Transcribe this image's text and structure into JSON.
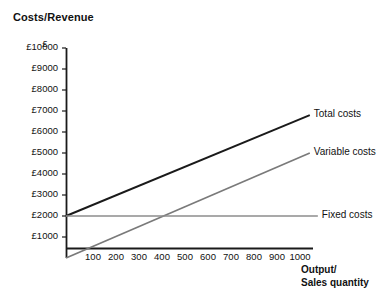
{
  "chart_data": {
    "type": "line",
    "title": "Costs/Revenue",
    "ylabel": "£",
    "xlabel": "Output/\nSales quantity",
    "xlabel_lines": [
      "Output/",
      "Sales quantity"
    ],
    "xlim": [
      0,
      1070
    ],
    "ylim": [
      0,
      10000
    ],
    "grid": false,
    "legend_position": "right-inline-labels",
    "yticks": [
      {
        "value": 10000,
        "label": "£10000"
      },
      {
        "value": 9000,
        "label": "£9000"
      },
      {
        "value": 8000,
        "label": "£8000"
      },
      {
        "value": 7000,
        "label": "£7000"
      },
      {
        "value": 6000,
        "label": "£6000"
      },
      {
        "value": 5000,
        "label": "£5000"
      },
      {
        "value": 4000,
        "label": "£4000"
      },
      {
        "value": 3000,
        "label": "£3000"
      },
      {
        "value": 2000,
        "label": "£2000"
      },
      {
        "value": 1000,
        "label": "£1000"
      }
    ],
    "xticks": [
      {
        "value": 100,
        "label": "100"
      },
      {
        "value": 200,
        "label": "200"
      },
      {
        "value": 300,
        "label": "300"
      },
      {
        "value": 400,
        "label": "400"
      },
      {
        "value": 500,
        "label": "500"
      },
      {
        "value": 600,
        "label": "600"
      },
      {
        "value": 700,
        "label": "700"
      },
      {
        "value": 800,
        "label": "800"
      },
      {
        "value": 900,
        "label": "900"
      },
      {
        "value": 1000,
        "label": "1000"
      }
    ],
    "series": [
      {
        "name": "Total costs",
        "label": "Total costs",
        "color": "#1a1a1a",
        "width": 1.9,
        "points": [
          [
            0,
            2000
          ],
          [
            1060,
            6800
          ]
        ]
      },
      {
        "name": "Variable costs",
        "label": "Variable costs",
        "color": "#7a7a7a",
        "width": 1.7,
        "points": [
          [
            0,
            0
          ],
          [
            1060,
            5000
          ]
        ]
      },
      {
        "name": "Fixed costs",
        "label": "Fixed costs",
        "color": "#8c8c8c",
        "width": 1.7,
        "points": [
          [
            0,
            2000
          ],
          [
            1095,
            2000
          ]
        ]
      }
    ],
    "annotations": {
      "breakeven_note": "Total costs and Fixed costs intersect near 300 units"
    },
    "axis_color": "#1a1a1a"
  }
}
